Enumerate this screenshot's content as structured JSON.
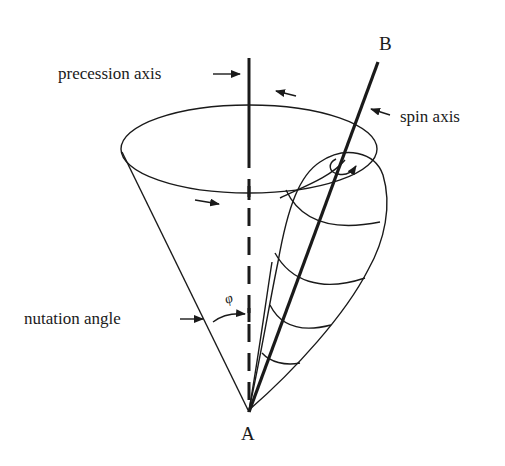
{
  "diagram": {
    "labels": {
      "precession_axis": "precession axis",
      "spin_axis": "spin axis",
      "nutation_angle": "nutation angle",
      "angle_symbol": "φ",
      "point_top": "B",
      "point_apex": "A"
    },
    "colors": {
      "stroke": "#1a1a1a",
      "background": "#ffffff"
    },
    "arrows": [
      {
        "name": "precession-axis-pointer",
        "direction": "right"
      },
      {
        "name": "spin-axis-pointer",
        "direction": "left"
      },
      {
        "name": "nutation-angle-pointer",
        "direction": "right"
      },
      {
        "name": "precession-direction-back",
        "direction": "left"
      },
      {
        "name": "precession-direction-front",
        "direction": "right"
      },
      {
        "name": "spin-rotation",
        "direction": "clockwise"
      }
    ]
  }
}
